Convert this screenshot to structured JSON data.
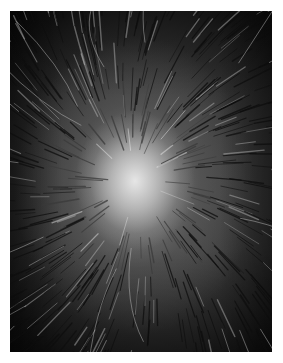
{
  "image": {
    "subject": "Top-down grayscale photograph of a scalp crown with thinning hair radiating outward from a bright bald spot",
    "alt": "Scalp crown with hair loss",
    "colors": {
      "background": "#ffffff",
      "center_highlight": "#e6e6e6",
      "hair_dark": "#0d0d0d",
      "hair_light": "#bdbdbd"
    },
    "crown_center": {
      "x": 125,
      "y": 170
    }
  }
}
